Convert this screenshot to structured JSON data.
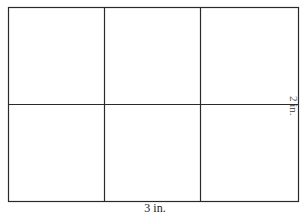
{
  "diagram": {
    "title": "",
    "grid": {
      "rows": 2,
      "columns": 3
    },
    "labels": {
      "width": "3 in.",
      "height": "2 in."
    },
    "colors": {
      "line": "#2a2a2a",
      "background": "#ffffff"
    }
  }
}
